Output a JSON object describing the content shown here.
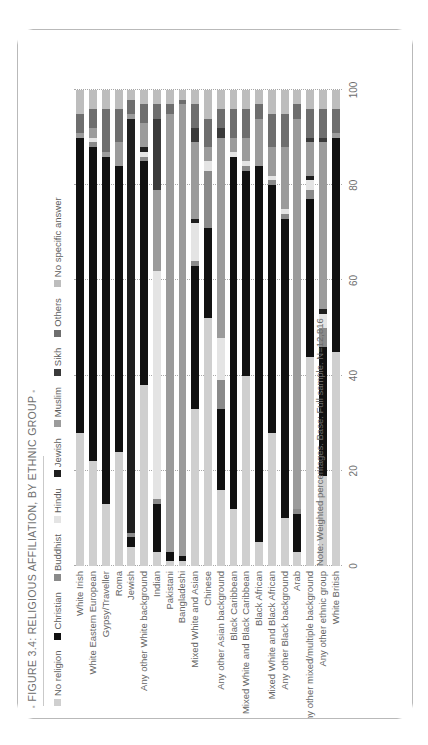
{
  "figure": {
    "title": "FIGURE 3.4: RELIGIOUS AFFILIATION, BY ETHNIC GROUP",
    "title_bullet": "▪",
    "note": "Note: Weighted percentages. Base: Full sample. N=12,816"
  },
  "chart_data": {
    "type": "bar",
    "orientation": "horizontal",
    "stacked": true,
    "stack_mode": "percent",
    "title": "FIGURE 3.4: RELIGIOUS AFFILIATION, BY ETHNIC GROUP",
    "subtitle": "",
    "xlabel": "",
    "ylabel": "",
    "xlim": [
      0,
      100
    ],
    "xticks": [
      0,
      20,
      40,
      60,
      80,
      100
    ],
    "xtick_labels": [
      "0",
      "20",
      "40",
      "60",
      "80",
      "100"
    ],
    "grid": "vertical-dotted",
    "legend_position": "top",
    "legend": [
      "No religion",
      "Christian",
      "Buddhist",
      "Hindu",
      "Jewish",
      "Muslim",
      "Sikh",
      "Others",
      "No specific answer"
    ],
    "colors": [
      "#cfcfcf",
      "#111111",
      "#8a8a8a",
      "#e4e4e4",
      "#1f1f1f",
      "#9b9b9b",
      "#3a3a3a",
      "#6e6e6e",
      "#bdbdbd"
    ],
    "categories": [
      "White Irish",
      "White Eastern European",
      "Gypsy/Traveller",
      "Roma",
      "Jewish",
      "Any other White background",
      "Indian",
      "Pakistani",
      "Bangladeshi",
      "Mixed White and Asian",
      "Chinese",
      "Any other Asian background",
      "Black Caribbean",
      "Mixed White and Black Caribbean",
      "Black African",
      "Mixed White and Black African",
      "Any other Black background",
      "Arab",
      "Any other mixed/multiple background",
      "Any other ethnic group",
      "White British"
    ],
    "series": [
      {
        "name": "No religion",
        "values": [
          28,
          22,
          13,
          24,
          4,
          38,
          3,
          1,
          1,
          33,
          52,
          16,
          12,
          40,
          5,
          28,
          10,
          3,
          44,
          19,
          45
        ]
      },
      {
        "name": "Christian",
        "values": [
          62,
          66,
          73,
          60,
          2,
          47,
          10,
          2,
          1,
          30,
          19,
          17,
          74,
          43,
          79,
          52,
          63,
          8,
          33,
          27,
          45
        ]
      },
      {
        "name": "Buddhist",
        "values": [
          0,
          1,
          0,
          0,
          1,
          1,
          1,
          0,
          0,
          1,
          12,
          6,
          0,
          1,
          0,
          1,
          1,
          1,
          2,
          4,
          0
        ]
      },
      {
        "name": "Hindu",
        "values": [
          0,
          1,
          0,
          0,
          0,
          1,
          48,
          0,
          0,
          8,
          2,
          9,
          1,
          1,
          0,
          1,
          1,
          0,
          2,
          3,
          0
        ]
      },
      {
        "name": "Jewish",
        "values": [
          0,
          0,
          0,
          0,
          87,
          1,
          0,
          0,
          0,
          1,
          0,
          0,
          0,
          0,
          0,
          0,
          0,
          0,
          1,
          1,
          0
        ]
      },
      {
        "name": "Muslim",
        "values": [
          1,
          2,
          1,
          5,
          1,
          5,
          17,
          92,
          95,
          16,
          3,
          42,
          3,
          5,
          10,
          6,
          13,
          82,
          7,
          35,
          1
        ]
      },
      {
        "name": "Sikh",
        "values": [
          0,
          0,
          0,
          0,
          0,
          0,
          15,
          0,
          0,
          3,
          0,
          2,
          0,
          0,
          0,
          0,
          0,
          0,
          1,
          1,
          0
        ]
      },
      {
        "name": "Others",
        "values": [
          4,
          4,
          9,
          7,
          3,
          4,
          3,
          2,
          1,
          5,
          6,
          4,
          6,
          6,
          3,
          7,
          7,
          3,
          6,
          6,
          5
        ]
      },
      {
        "name": "No specific answer",
        "values": [
          5,
          4,
          4,
          4,
          2,
          3,
          3,
          3,
          2,
          3,
          6,
          4,
          4,
          4,
          3,
          5,
          5,
          3,
          4,
          4,
          4
        ]
      }
    ]
  }
}
